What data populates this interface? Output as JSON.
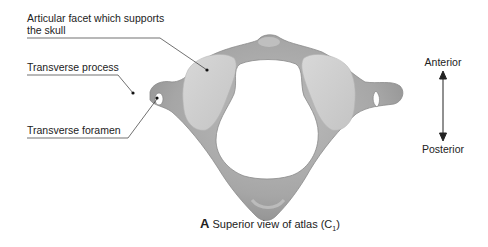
{
  "figure": {
    "title_letter": "A",
    "caption_text": "Superior view of atlas (C",
    "caption_subscript": "1",
    "caption_close": ")"
  },
  "labels": [
    {
      "id": "articular-facet",
      "text": "Articular facet which supports the skull"
    },
    {
      "id": "transverse-process",
      "text": "Transverse process"
    },
    {
      "id": "transverse-foramen",
      "text": "Transverse foramen"
    }
  ],
  "orientation": {
    "top": "Anterior",
    "bottom": "Posterior"
  },
  "colors": {
    "bone": "#a9a9a9",
    "bone_shadow": "#8c8c8c",
    "facet": "#cfcfcf",
    "leader_line": "#333333"
  }
}
